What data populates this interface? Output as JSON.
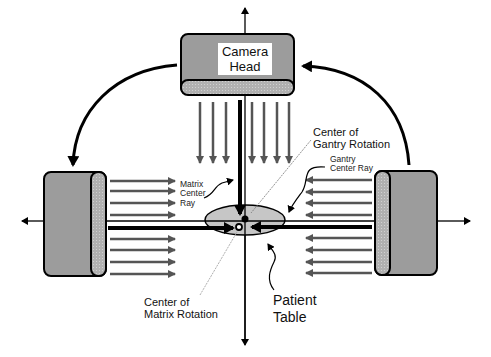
{
  "diagram": {
    "type": "SPECT gamma camera gantry geometry schematic",
    "camera_head": {
      "line1": "Camera",
      "line2": "Head"
    },
    "labels": {
      "matrix_center_ray": [
        "Matrix",
        "Center",
        "Ray"
      ],
      "center_of_gantry_rotation": [
        "Center of",
        "Gantry Rotation"
      ],
      "gantry_center_ray": [
        "Gantry",
        "Center Ray"
      ],
      "center_of_matrix_rotation": [
        "Center of",
        "Matrix Rotation"
      ],
      "patient_table": [
        "Patient",
        "Table"
      ]
    },
    "components": [
      "camera-head-top",
      "camera-head-left",
      "camera-head-right",
      "rotation-arrow-top-to-left",
      "rotation-arrow-right-to-top",
      "patient-table-ellipse",
      "vertical-axis",
      "horizontal-axis"
    ],
    "colors": {
      "detector_body": "#9a9a9a",
      "collimator": "#b4b4b4",
      "ray_arrows": "#555555",
      "lines": "#000000",
      "table": "#c4c4c4"
    }
  }
}
